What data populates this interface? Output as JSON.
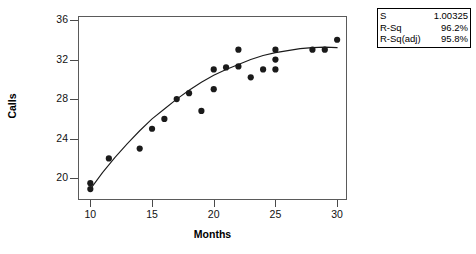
{
  "chart_data": {
    "type": "scatter",
    "title": "",
    "xlabel": "Months",
    "ylabel": "Calls",
    "xlim": [
      9,
      30.8
    ],
    "ylim": [
      17.8,
      36.4
    ],
    "xticks": [
      10,
      15,
      20,
      25,
      30
    ],
    "yticks": [
      20,
      24,
      28,
      32,
      36
    ],
    "grid": false,
    "legend": null,
    "points": [
      {
        "x": 10.0,
        "y": 19.5
      },
      {
        "x": 10.0,
        "y": 18.9
      },
      {
        "x": 11.5,
        "y": 22.0
      },
      {
        "x": 14.0,
        "y": 23.0
      },
      {
        "x": 15.0,
        "y": 25.0
      },
      {
        "x": 16.0,
        "y": 26.0
      },
      {
        "x": 17.0,
        "y": 28.0
      },
      {
        "x": 18.0,
        "y": 28.6
      },
      {
        "x": 19.0,
        "y": 26.8
      },
      {
        "x": 20.0,
        "y": 29.0
      },
      {
        "x": 20.0,
        "y": 31.0
      },
      {
        "x": 21.0,
        "y": 31.2
      },
      {
        "x": 22.0,
        "y": 33.0
      },
      {
        "x": 22.0,
        "y": 31.3
      },
      {
        "x": 23.0,
        "y": 30.2
      },
      {
        "x": 25.0,
        "y": 33.0
      },
      {
        "x": 25.0,
        "y": 32.0
      },
      {
        "x": 25.0,
        "y": 31.0
      },
      {
        "x": 24.0,
        "y": 31.0
      },
      {
        "x": 28.0,
        "y": 33.0
      },
      {
        "x": 29.0,
        "y": 33.0
      },
      {
        "x": 30.0,
        "y": 34.0
      }
    ],
    "fit_curve": {
      "label": "fitted curve",
      "points": [
        {
          "x": 10.0,
          "y": 18.9
        },
        {
          "x": 11.0,
          "y": 20.6
        },
        {
          "x": 12.0,
          "y": 22.1
        },
        {
          "x": 13.0,
          "y": 23.5
        },
        {
          "x": 14.0,
          "y": 24.8
        },
        {
          "x": 15.0,
          "y": 26.0
        },
        {
          "x": 16.0,
          "y": 27.0
        },
        {
          "x": 17.0,
          "y": 28.0
        },
        {
          "x": 18.0,
          "y": 28.9
        },
        {
          "x": 19.0,
          "y": 29.7
        },
        {
          "x": 20.0,
          "y": 30.4
        },
        {
          "x": 21.0,
          "y": 31.0
        },
        {
          "x": 22.0,
          "y": 31.5
        },
        {
          "x": 23.0,
          "y": 32.0
        },
        {
          "x": 24.0,
          "y": 32.4
        },
        {
          "x": 25.0,
          "y": 32.7
        },
        {
          "x": 26.0,
          "y": 32.9
        },
        {
          "x": 27.0,
          "y": 33.1
        },
        {
          "x": 28.0,
          "y": 33.2
        },
        {
          "x": 29.0,
          "y": 33.25
        },
        {
          "x": 30.0,
          "y": 33.2
        }
      ]
    },
    "marker_color": "#1a1a1a",
    "curve_color": "#1a1a1a",
    "axis_color": "#4a4a4a"
  },
  "stats_box": {
    "rows": [
      {
        "key": "S",
        "value": "1.00325"
      },
      {
        "key": "R-Sq",
        "value": "96.2%"
      },
      {
        "key": "R-Sq(adj)",
        "value": "95.8%"
      }
    ]
  }
}
